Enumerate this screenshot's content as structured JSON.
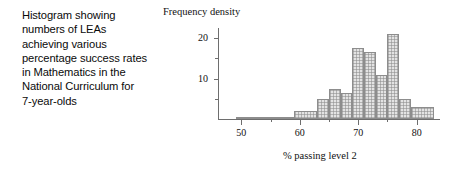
{
  "caption": {
    "lines": [
      "Histogram showing",
      "numbers of LEAs",
      "achieving various",
      "percentage success rates",
      "in Mathematics in the",
      "National Curriculum for",
      "7-year-olds"
    ]
  },
  "chart_data": {
    "type": "bar",
    "title": "",
    "xlabel": "% passing level 2",
    "ylabel": "Frequency density",
    "xlim": [
      46,
      84
    ],
    "ylim": [
      0,
      22.5
    ],
    "grid": false,
    "legend": null,
    "x_ticks": [
      50,
      60,
      70,
      80
    ],
    "x_tick_labels": [
      "50",
      "60",
      "70",
      "80"
    ],
    "x_minor_ticks": [
      55,
      65,
      75
    ],
    "y_ticks": [
      10,
      20
    ],
    "y_tick_labels": [
      "10",
      "20"
    ],
    "y_minor_ticks": [
      5,
      15
    ],
    "bins": [
      {
        "start": 49,
        "end": 59,
        "density": 0.5
      },
      {
        "start": 59,
        "end": 63,
        "density": 2.0
      },
      {
        "start": 63,
        "end": 65,
        "density": 5.0
      },
      {
        "start": 65,
        "end": 67,
        "density": 7.5
      },
      {
        "start": 67,
        "end": 69,
        "density": 6.5
      },
      {
        "start": 69,
        "end": 71,
        "density": 17.5
      },
      {
        "start": 71,
        "end": 73,
        "density": 16.5
      },
      {
        "start": 73,
        "end": 75,
        "density": 11.0
      },
      {
        "start": 75,
        "end": 77,
        "density": 21.0
      },
      {
        "start": 77,
        "end": 79,
        "density": 5.0
      },
      {
        "start": 79,
        "end": 83,
        "density": 3.0
      }
    ],
    "bar_face_color": "#e3e3e3",
    "bar_edge_color": "#8d8d8d",
    "axis_color": "#6e6e6e"
  }
}
